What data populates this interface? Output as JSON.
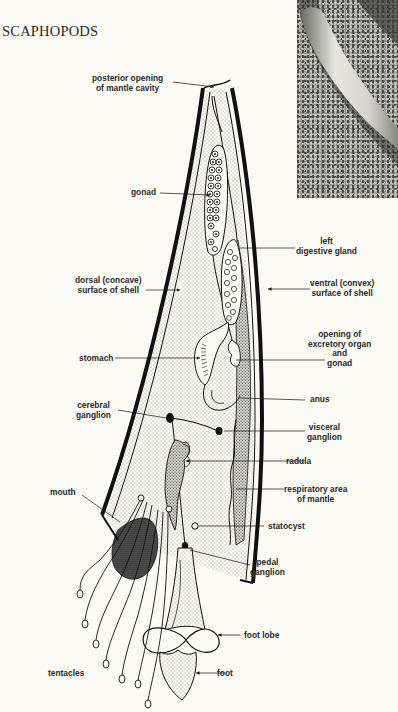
{
  "page": {
    "heading": "SCAPHOPODS"
  },
  "photo": {
    "subject": "scaphopod-shell-on-sand-photo"
  },
  "diagram": {
    "colors": {
      "ink": "#111111",
      "paper": "#fbfaf4",
      "label": "#2b2b2b"
    },
    "labels": {
      "posterior_opening_1": "posterior opening",
      "posterior_opening_2": "of mantle cavity",
      "gonad": "gonad",
      "left_digestive_gland_1": "left",
      "left_digestive_gland_2": "digestive gland",
      "dorsal_surface_1": "dorsal (concave)",
      "dorsal_surface_2": "surface of shell",
      "ventral_surface_1": "ventral (convex)",
      "ventral_surface_2": "surface of shell",
      "excretory_opening_1": "opening of",
      "excretory_opening_2": "excretory organ",
      "excretory_opening_3": "and",
      "excretory_opening_4": "gonad",
      "stomach": "stomach",
      "anus": "anus",
      "cerebral_ganglion_1": "cerebral",
      "cerebral_ganglion_2": "ganglion",
      "visceral_ganglion_1": "visceral",
      "visceral_ganglion_2": "ganglion",
      "radula": "radula",
      "mouth": "mouth",
      "respiratory_area_1": "respiratory area",
      "respiratory_area_2": "of mantle",
      "statocyst": "statocyst",
      "pedal_ganglion_1": "pedal",
      "pedal_ganglion_2": "ganglion",
      "foot_lobe": "foot lobe",
      "tentacles": "tentacles",
      "foot": "foot"
    }
  }
}
